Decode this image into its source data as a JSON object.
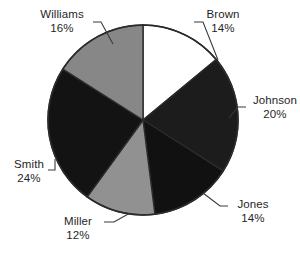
{
  "chart_data": {
    "type": "pie",
    "title": "",
    "subtitle": "",
    "xlabel": "",
    "ylabel": "",
    "legend_position": "none",
    "labels_position": "outside-with-leader-lines",
    "grid": false,
    "start_angle_deg": 0,
    "direction": "clockwise",
    "categories": [
      "Brown",
      "Johnson",
      "Jones",
      "Miller",
      "Smith",
      "Williams"
    ],
    "values": [
      14,
      20,
      14,
      12,
      24,
      16
    ],
    "value_suffix": "%",
    "total": 100,
    "slices": [
      {
        "name": "Brown",
        "value": 14,
        "value_text": "14%",
        "color": "#ffffff",
        "stroke": "#2b2b2b"
      },
      {
        "name": "Johnson",
        "value": 20,
        "value_text": "20%",
        "color": "#1c1c1c",
        "stroke": "#2b2b2b"
      },
      {
        "name": "Jones",
        "value": 14,
        "value_text": "14%",
        "color": "#111111",
        "stroke": "#2b2b2b"
      },
      {
        "name": "Miller",
        "value": 12,
        "value_text": "12%",
        "color": "#919191",
        "stroke": "#2b2b2b"
      },
      {
        "name": "Smith",
        "value": 24,
        "value_text": "24%",
        "color": "#131313",
        "stroke": "#2b2b2b"
      },
      {
        "name": "Williams",
        "value": 16,
        "value_text": "16%",
        "color": "#878787",
        "stroke": "#2b2b2b"
      }
    ],
    "colors": {
      "background": "#ffffff",
      "outline": "#2b2b2b",
      "leader_line": "#3a3a3a",
      "label_text": "#1f1f1f"
    }
  }
}
